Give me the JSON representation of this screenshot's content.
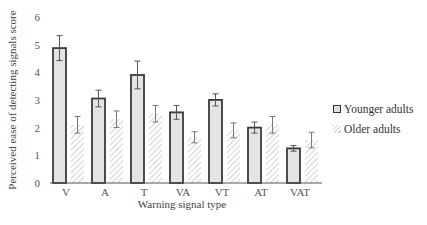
{
  "chart_data": {
    "type": "bar",
    "title": "",
    "xlabel": "Warning signal type",
    "ylabel": "Perceived ease of detecting signals score",
    "ylim": [
      0,
      6
    ],
    "yticks": [
      0,
      1,
      2,
      3,
      4,
      5,
      6
    ],
    "grid": false,
    "legend_position": "right",
    "categories": [
      "V",
      "A",
      "T",
      "VA",
      "VT",
      "AT",
      "VAT"
    ],
    "series": [
      {
        "name": "Younger adults",
        "style": "solid light gray with dark outline",
        "values": [
          4.87,
          3.05,
          3.9,
          2.55,
          3.0,
          2.0,
          1.25
        ],
        "error": [
          0.45,
          0.3,
          0.5,
          0.25,
          0.22,
          0.2,
          0.1
        ]
      },
      {
        "name": "Older adults",
        "style": "diagonal hatch",
        "values": [
          2.1,
          2.3,
          2.5,
          1.65,
          1.9,
          2.1,
          1.55
        ],
        "error": [
          0.3,
          0.3,
          0.3,
          0.2,
          0.27,
          0.3,
          0.28
        ]
      }
    ]
  },
  "legend": {
    "items": [
      {
        "label": "Younger adults"
      },
      {
        "label": "Older adults"
      }
    ]
  },
  "axes": {
    "x_title": "Warning signal type",
    "y_title": "Perceived ease of detecting signals score"
  }
}
